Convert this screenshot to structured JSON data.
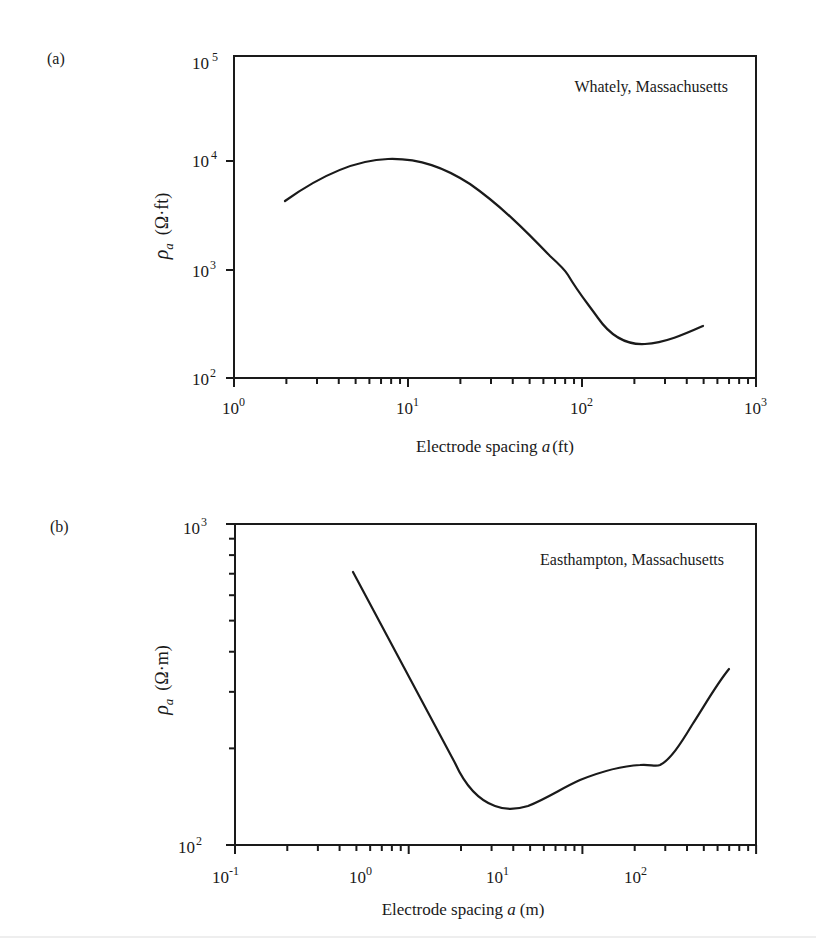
{
  "chart_data": [
    {
      "panel": "(a)",
      "type": "line",
      "title": "",
      "annotation": "Whately, Massachusetts",
      "xlabel": "Electrode spacing a (ft)",
      "ylabel": "ρa (Ω·ft)",
      "xscale": "log",
      "yscale": "log",
      "xlim": [
        1,
        1000
      ],
      "ylim": [
        100,
        100000
      ],
      "x_ticks": [
        {
          "base": "10",
          "exp": "0"
        },
        {
          "base": "10",
          "exp": "1"
        },
        {
          "base": "10",
          "exp": "2"
        },
        {
          "base": "10",
          "exp": "3"
        }
      ],
      "y_ticks": [
        {
          "base": "10",
          "exp": "2"
        },
        {
          "base": "10",
          "exp": "3"
        },
        {
          "base": "10",
          "exp": "4"
        },
        {
          "base": "10",
          "exp": "5"
        }
      ],
      "grid": false,
      "series": [
        {
          "name": "Whately sounding",
          "x": [
            1.96,
            3,
            5,
            7.9,
            12,
            20,
            35,
            50,
            80,
            100,
            130,
            170,
            224,
            300,
            400,
            500
          ],
          "y": [
            4500,
            6800,
            9300,
            10200,
            9600,
            6900,
            3600,
            2300,
            1250,
            900,
            560,
            300,
            210,
            225,
            265,
            305
          ]
        }
      ]
    },
    {
      "panel": "(b)",
      "type": "line",
      "title": "",
      "annotation": "Easthampton, Massachusetts",
      "xlabel": "Electrode spacing a (m)",
      "ylabel": "ρa (Ω·m)",
      "xscale": "log",
      "yscale": "log",
      "xlim": [
        0.1,
        100
      ],
      "ylim": [
        100,
        1000
      ],
      "x_ticks": [
        {
          "base": "10",
          "exp": "-1"
        },
        {
          "base": "10",
          "exp": "0"
        },
        {
          "base": "10",
          "exp": "1"
        },
        {
          "base": "10",
          "exp": "2"
        }
      ],
      "y_ticks": [
        {
          "base": "10",
          "exp": "2"
        },
        {
          "base": "10",
          "exp": "3"
        }
      ],
      "grid": false,
      "series": [
        {
          "name": "Easthampton sounding",
          "x": [
            0.48,
            0.7,
            1.0,
            1.5,
            1.9,
            2.5,
            3.76,
            5,
            7,
            10,
            15,
            24,
            30,
            40,
            55,
            69
          ],
          "y": [
            710,
            520,
            380,
            240,
            176,
            140,
            130,
            138,
            152,
            163,
            172,
            176,
            200,
            255,
            320,
            353
          ]
        }
      ]
    }
  ],
  "panels": {
    "a": {
      "label": "(a)",
      "annotation": "Whately, Massachusetts",
      "xlabel_text": "Electrode spacing ",
      "xlabel_var": "a",
      "xlabel_unit": "(ft)",
      "ylabel_sym": "ρ",
      "ylabel_sub": "a",
      "ylabel_unit": "(Ω·ft)",
      "xticks": [
        {
          "base": "10",
          "exp": "0"
        },
        {
          "base": "10",
          "exp": "1"
        },
        {
          "base": "10",
          "exp": "2"
        },
        {
          "base": "10",
          "exp": "3"
        }
      ],
      "yticks": [
        {
          "base": "10",
          "exp": "2"
        },
        {
          "base": "10",
          "exp": "3"
        },
        {
          "base": "10",
          "exp": "4"
        },
        {
          "base": "10",
          "exp": "5"
        }
      ]
    },
    "b": {
      "label": "(b)",
      "annotation": "Easthampton, Massachusetts",
      "xlabel_text": "Electrode spacing ",
      "xlabel_var": "a",
      "xlabel_unit": "(m)",
      "ylabel_sym": "ρ",
      "ylabel_sub": "a",
      "ylabel_unit": "(Ω·m)",
      "xticks": [
        {
          "base": "10",
          "exp": "-1"
        },
        {
          "base": "10",
          "exp": "0"
        },
        {
          "base": "10",
          "exp": "1"
        },
        {
          "base": "10",
          "exp": "2"
        }
      ],
      "yticks": [
        {
          "base": "10",
          "exp": "2"
        },
        {
          "base": "10",
          "exp": "3"
        }
      ]
    }
  },
  "colors": {
    "ink": "#1a1a1a",
    "background": "#ffffff"
  }
}
